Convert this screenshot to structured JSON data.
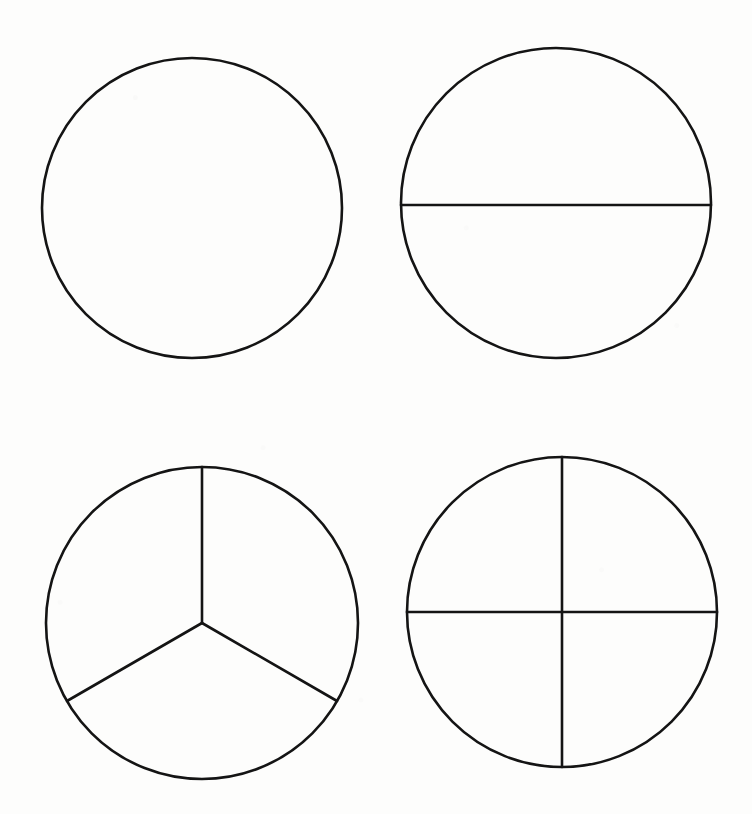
{
  "page": {
    "width": 752,
    "height": 814,
    "background_color": "#fdfdfc",
    "stroke_color": "#141414",
    "figure_count": 4
  },
  "figures": [
    {
      "id": "circle-whole",
      "name": "whole-circle",
      "label": "Whole circle (1 part)",
      "fraction": "1/1",
      "parts": 1,
      "cx": 192,
      "cy": 208,
      "r": 150,
      "stroke_width": 2.6,
      "dividers": [],
      "divider_description": "no dividing lines"
    },
    {
      "id": "circle-halves",
      "name": "halved-circle",
      "label": "Circle divided into halves (2 parts)",
      "fraction": "1/2",
      "parts": 2,
      "cx": 556,
      "cy": 203,
      "r": 155,
      "stroke_width": 2.6,
      "dividers": [
        {
          "name": "horizontal-diameter",
          "x1": 401,
          "y1": 205,
          "x2": 711,
          "y2": 205,
          "stroke_width": 2.6
        }
      ],
      "divider_description": "one horizontal diameter"
    },
    {
      "id": "circle-thirds",
      "name": "thirds-circle",
      "label": "Circle divided into thirds (3 parts)",
      "fraction": "1/3",
      "parts": 3,
      "cx": 202,
      "cy": 623,
      "r": 156,
      "stroke_width": 2.6,
      "dividers": [
        {
          "name": "radius-up",
          "x1": 202,
          "y1": 623,
          "x2": 202,
          "y2": 467,
          "stroke_width": 2.6
        },
        {
          "name": "radius-lower-left",
          "x1": 202,
          "y1": 623,
          "x2": 67,
          "y2": 701,
          "stroke_width": 2.6
        },
        {
          "name": "radius-lower-right",
          "x1": 202,
          "y1": 623,
          "x2": 337,
          "y2": 701,
          "stroke_width": 2.6
        }
      ],
      "divider_description": "three radii at 90, 210 and 330 degrees"
    },
    {
      "id": "circle-quarters",
      "name": "quarters-circle",
      "label": "Circle divided into quarters (4 parts)",
      "fraction": "1/4",
      "parts": 4,
      "cx": 562,
      "cy": 612,
      "r": 155,
      "stroke_width": 2.6,
      "dividers": [
        {
          "name": "vertical-diameter",
          "x1": 562,
          "y1": 457,
          "x2": 562,
          "y2": 767,
          "stroke_width": 2.6
        },
        {
          "name": "horizontal-diameter",
          "x1": 407,
          "y1": 612,
          "x2": 717,
          "y2": 612,
          "stroke_width": 2.6
        }
      ],
      "divider_description": "vertical and horizontal diameters forming a cross"
    }
  ]
}
